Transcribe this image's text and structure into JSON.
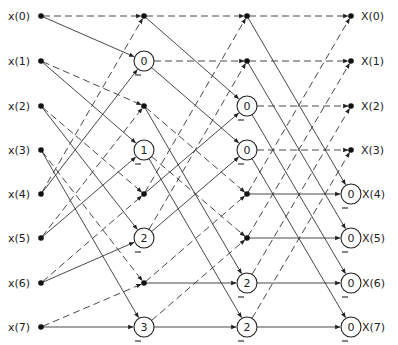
{
  "diagram": {
    "layout": {
      "columns_x": [
        41,
        144,
        247,
        351
      ],
      "rows_y": [
        16,
        61,
        106,
        150,
        194,
        238,
        283,
        327
      ],
      "circle_radius": 10,
      "line_color": "#333333",
      "node_color": "#111111"
    },
    "inputs": [
      "x(0)",
      "x(1)",
      "x(2)",
      "x(3)",
      "x(4)",
      "x(5)",
      "x(6)",
      "x(7)"
    ],
    "outputs": [
      "X(0)",
      "X(1)",
      "X(2)",
      "X(3)",
      "X(4)",
      "X(5)",
      "X(6)",
      "X(7)"
    ],
    "stages": [
      {
        "name": "stage-1",
        "nodes": [
          {
            "type": "dot"
          },
          {
            "type": "circle",
            "label": "0"
          },
          {
            "type": "dot"
          },
          {
            "type": "circle",
            "label": "1"
          },
          {
            "type": "dot"
          },
          {
            "type": "circle",
            "label": "2"
          },
          {
            "type": "dot"
          },
          {
            "type": "circle",
            "label": "3"
          }
        ]
      },
      {
        "name": "stage-2",
        "nodes": [
          {
            "type": "dot"
          },
          {
            "type": "dot"
          },
          {
            "type": "circle",
            "label": "0"
          },
          {
            "type": "circle",
            "label": "0"
          },
          {
            "type": "dot"
          },
          {
            "type": "dot"
          },
          {
            "type": "circle",
            "label": "2"
          },
          {
            "type": "circle",
            "label": "2"
          }
        ]
      },
      {
        "name": "output",
        "nodes": [
          {
            "type": "dot"
          },
          {
            "type": "dot"
          },
          {
            "type": "dot"
          },
          {
            "type": "dot"
          },
          {
            "type": "circle",
            "label": "0"
          },
          {
            "type": "circle",
            "label": "0"
          },
          {
            "type": "circle",
            "label": "0"
          },
          {
            "type": "circle",
            "label": "0"
          }
        ]
      }
    ],
    "edges": [
      [
        [
          0,
          0,
          "d"
        ],
        [
          0,
          1,
          "s"
        ],
        [
          1,
          2,
          "d"
        ],
        [
          1,
          3,
          "s"
        ],
        [
          2,
          4,
          "d"
        ],
        [
          2,
          5,
          "s"
        ],
        [
          3,
          6,
          "d"
        ],
        [
          3,
          7,
          "s"
        ],
        [
          4,
          0,
          "d"
        ],
        [
          4,
          1,
          "s"
        ],
        [
          5,
          2,
          "d"
        ],
        [
          5,
          3,
          "s"
        ],
        [
          6,
          4,
          "d"
        ],
        [
          6,
          5,
          "s"
        ],
        [
          7,
          6,
          "d"
        ],
        [
          7,
          7,
          "s"
        ]
      ],
      [
        [
          0,
          0,
          "d"
        ],
        [
          0,
          2,
          "s"
        ],
        [
          1,
          1,
          "d"
        ],
        [
          1,
          3,
          "s"
        ],
        [
          2,
          4,
          "d"
        ],
        [
          2,
          6,
          "s"
        ],
        [
          3,
          5,
          "d"
        ],
        [
          3,
          7,
          "s"
        ],
        [
          4,
          0,
          "d"
        ],
        [
          4,
          2,
          "s"
        ],
        [
          5,
          1,
          "d"
        ],
        [
          5,
          3,
          "s"
        ],
        [
          6,
          4,
          "d"
        ],
        [
          6,
          6,
          "s"
        ],
        [
          7,
          5,
          "d"
        ],
        [
          7,
          7,
          "s"
        ]
      ],
      [
        [
          0,
          0,
          "d"
        ],
        [
          0,
          4,
          "s"
        ],
        [
          1,
          1,
          "d"
        ],
        [
          1,
          5,
          "s"
        ],
        [
          2,
          2,
          "d"
        ],
        [
          2,
          6,
          "s"
        ],
        [
          3,
          3,
          "d"
        ],
        [
          3,
          7,
          "s"
        ],
        [
          4,
          0,
          "d"
        ],
        [
          4,
          4,
          "s"
        ],
        [
          5,
          1,
          "d"
        ],
        [
          5,
          5,
          "s"
        ],
        [
          6,
          2,
          "d"
        ],
        [
          6,
          6,
          "s"
        ],
        [
          7,
          3,
          "d"
        ],
        [
          7,
          7,
          "s"
        ]
      ]
    ],
    "legend_note": "dashed = addition path, solid = subtraction/twiddle path; circled numbers are twiddle exponents; '–' marks negation"
  }
}
